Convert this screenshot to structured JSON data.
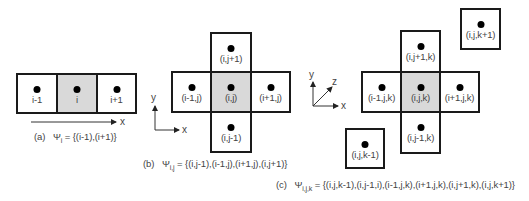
{
  "panel_a": {
    "cells": [
      {
        "label": "i-1"
      },
      {
        "label": "i"
      },
      {
        "label": "i+1"
      }
    ],
    "axis": {
      "x": "x"
    },
    "caption": {
      "tag": "(a)",
      "psi": "Ψ",
      "sub": "i",
      "rhs": "= {(i-1),(i+1)}"
    }
  },
  "panel_b": {
    "cells": {
      "top": "(i,j+1)",
      "left": "(i-1,j)",
      "center": "(i,j)",
      "right": "(i+1,j)",
      "bottom": "(i,j-1)"
    },
    "axis": {
      "x": "x",
      "y": "y"
    },
    "caption": {
      "tag": "(b)",
      "psi": "Ψ",
      "sub": "i,j",
      "rhs": "= {(i,j-1),(i-1,j),(i+1,j),(i,j+1)}"
    }
  },
  "panel_c": {
    "cells": {
      "front": "(i,j,k+1)",
      "top": "(i,j+1,k)",
      "left": "(i-1,j,k)",
      "center": "(i,j,k)",
      "right": "(i+1,j,k)",
      "bottom": "(i,j-1,k)",
      "back": "(i,j,k-1)"
    },
    "axis": {
      "x": "x",
      "y": "y",
      "z": "z"
    },
    "caption": {
      "tag": "(c)",
      "psi": "Ψ",
      "sub": "i,j,k",
      "rhs": "= {(i,j,k-1),(i,j-1,i),(i-1,j,k),(i+1,j,k),(i,j+1,k),(i,j,k+1)}"
    }
  },
  "colors": {
    "border": "#1a1a1a",
    "center_fill": "#d9d9d9",
    "text": "#444444"
  }
}
